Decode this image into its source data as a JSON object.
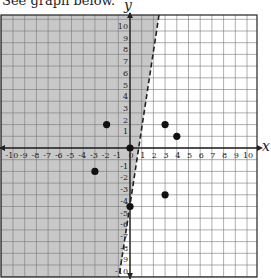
{
  "caption": "See graph below.",
  "chart_data": {
    "type": "scatter",
    "title": "",
    "xlabel": "x",
    "ylabel": "y",
    "xlim": [
      -11,
      11
    ],
    "ylim": [
      -10,
      11
    ],
    "grid": true,
    "x_ticks": [
      -10,
      -9,
      -8,
      -7,
      -6,
      -5,
      -4,
      -3,
      -2,
      -1,
      0,
      1,
      2,
      3,
      4,
      5,
      6,
      7,
      8,
      9,
      10
    ],
    "y_ticks": [
      -10,
      -9,
      -8,
      -7,
      -6,
      -5,
      -4,
      -3,
      -2,
      -1,
      1,
      2,
      3,
      4,
      5,
      6,
      7,
      8,
      9,
      10
    ],
    "points": [
      {
        "x": -2,
        "y": 2
      },
      {
        "x": 3,
        "y": 2
      },
      {
        "x": 4,
        "y": 1
      },
      {
        "x": 0,
        "y": 0
      },
      {
        "x": -3,
        "y": -2
      },
      {
        "x": 3,
        "y": -4
      },
      {
        "x": 0,
        "y": -5
      }
    ],
    "boundary_line": {
      "style": "dashed",
      "approx_equation": "y = 5x - 5",
      "through": [
        [
          0,
          -5
        ],
        [
          1,
          0
        ]
      ]
    },
    "shaded_region": "left of dashed line (y > 5x - 5)",
    "colors": {
      "shade": "#c8c8c8",
      "grid": "#777777",
      "axis": "#222222",
      "point": "#111111"
    }
  }
}
